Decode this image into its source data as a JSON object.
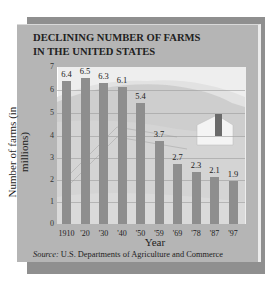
{
  "title_line1": "DECLINING NUMBER OF FARMS",
  "title_line2": "IN THE UNITED STATES",
  "ylabel": "Number of farms (in millions)",
  "xlabel": "Year",
  "source_label": "Source:",
  "source_text": " U.S. Departments of Agriculture and Commerce",
  "yticks": [
    "0",
    "1",
    "2",
    "3",
    "4",
    "5",
    "6",
    "7"
  ],
  "chart_data": {
    "type": "bar",
    "title": "DECLINING NUMBER OF FARMS IN THE UNITED STATES",
    "xlabel": "Year",
    "ylabel": "Number of farms (in millions)",
    "categories": [
      "1910",
      "'20",
      "'30",
      "'40",
      "'50",
      "'59",
      "'69",
      "'78",
      "'87",
      "'97"
    ],
    "values": [
      6.4,
      6.5,
      6.3,
      6.1,
      5.4,
      3.7,
      2.7,
      2.3,
      2.1,
      1.9
    ],
    "value_labels": [
      "6.4",
      "6.5",
      "6.3",
      "6.1",
      "5.4",
      "3.7",
      "2.7",
      "2.3",
      "2.1",
      "1.9"
    ],
    "ylim": [
      0,
      7
    ],
    "yticks": [
      0,
      1,
      2,
      3,
      4,
      5,
      6,
      7
    ],
    "grid": true,
    "source": "Source: U.S. Departments of Agriculture and Commerce",
    "bar_color": "#8e8e8e"
  }
}
